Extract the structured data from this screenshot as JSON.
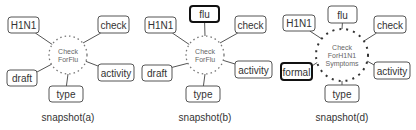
{
  "snapshots": [
    {
      "caption": "snapshot(a)",
      "hub": {
        "lines": [
          "Check",
          "ForFlu"
        ],
        "cx": 68,
        "cy": 55,
        "r": 19,
        "dense": false
      },
      "nodes": [
        {
          "label": "H1N1",
          "x": 8,
          "y": 17,
          "w": 31,
          "h": 16,
          "highlight": false,
          "ax": 53,
          "ay": 45
        },
        {
          "label": "check",
          "x": 98,
          "y": 16,
          "w": 31,
          "h": 17,
          "highlight": false,
          "ax": 83,
          "ay": 43
        },
        {
          "label": "draft",
          "x": 7,
          "y": 70,
          "w": 30,
          "h": 16,
          "highlight": false,
          "ax": 52,
          "ay": 64
        },
        {
          "label": "activity",
          "x": 98,
          "y": 64,
          "w": 36,
          "h": 17,
          "highlight": false,
          "ax": 85,
          "ay": 61
        },
        {
          "label": "type",
          "x": 49,
          "y": 86,
          "w": 34,
          "h": 16,
          "highlight": false,
          "ax": 68,
          "ay": 74
        }
      ]
    },
    {
      "caption": "snapshot(b)",
      "hub": {
        "lines": [
          "Check",
          "ForFlu"
        ],
        "cx": 205,
        "cy": 55,
        "r": 19,
        "dense": false
      },
      "nodes": [
        {
          "label": "flu",
          "x": 190,
          "y": 6,
          "w": 29,
          "h": 16,
          "highlight": true,
          "ax": 205,
          "ay": 36
        },
        {
          "label": "H1N1",
          "x": 145,
          "y": 17,
          "w": 31,
          "h": 16,
          "highlight": false,
          "ax": 190,
          "ay": 45
        },
        {
          "label": "check",
          "x": 235,
          "y": 16,
          "w": 31,
          "h": 17,
          "highlight": false,
          "ax": 220,
          "ay": 43
        },
        {
          "label": "draft",
          "x": 142,
          "y": 65,
          "w": 30,
          "h": 16,
          "highlight": false,
          "ax": 189,
          "ay": 63
        },
        {
          "label": "activity",
          "x": 235,
          "y": 61,
          "w": 37,
          "h": 17,
          "highlight": false,
          "ax": 222,
          "ay": 60
        },
        {
          "label": "type",
          "x": 186,
          "y": 86,
          "w": 34,
          "h": 16,
          "highlight": false,
          "ax": 205,
          "ay": 74
        }
      ]
    },
    {
      "caption": "snapshot(d)",
      "hub": {
        "lines": [
          "Check",
          "ForH1N1",
          "Symptoms"
        ],
        "cx": 342,
        "cy": 55,
        "r": 26,
        "dense": true
      },
      "nodes": [
        {
          "label": "flu",
          "x": 328,
          "y": 6,
          "w": 29,
          "h": 17,
          "highlight": false,
          "ax": 342,
          "ay": 29
        },
        {
          "label": "H1N1",
          "x": 283,
          "y": 15,
          "w": 32,
          "h": 16,
          "highlight": false,
          "ax": 322,
          "ay": 39
        },
        {
          "label": "check",
          "x": 374,
          "y": 16,
          "w": 32,
          "h": 17,
          "highlight": false,
          "ax": 364,
          "ay": 41
        },
        {
          "label": "formal",
          "x": 281,
          "y": 63,
          "w": 31,
          "h": 17,
          "highlight": true,
          "ax": 318,
          "ay": 62
        },
        {
          "label": "activity",
          "x": 374,
          "y": 62,
          "w": 36,
          "h": 17,
          "highlight": false,
          "ax": 367,
          "ay": 61
        },
        {
          "label": "type",
          "x": 325,
          "y": 85,
          "w": 34,
          "h": 17,
          "highlight": false,
          "ax": 342,
          "ay": 81
        }
      ]
    }
  ]
}
